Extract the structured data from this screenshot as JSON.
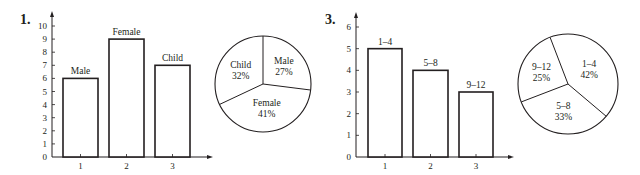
{
  "problems": [
    {
      "number": "1."
    },
    {
      "number": "3."
    }
  ],
  "chart_data": [
    {
      "type": "bar",
      "title": "",
      "categories": [
        "1",
        "2",
        "3"
      ],
      "bar_labels": [
        "Male",
        "Female",
        "Child"
      ],
      "values": [
        6,
        9,
        7
      ],
      "xlabel": "",
      "ylabel": "",
      "ylim": [
        0,
        10
      ],
      "yticks": [
        "0",
        "1",
        "2",
        "3",
        "4",
        "5",
        "6",
        "7",
        "8",
        "9",
        "10"
      ],
      "grid": false
    },
    {
      "type": "pie",
      "title": "",
      "labels": [
        "Male",
        "Female",
        "Child"
      ],
      "values": [
        27,
        41,
        32
      ],
      "value_labels": [
        "27%",
        "41%",
        "32%"
      ]
    },
    {
      "type": "bar",
      "title": "",
      "categories": [
        "1",
        "2",
        "3"
      ],
      "bar_labels": [
        "1–4",
        "5–8",
        "9–12"
      ],
      "values": [
        5,
        4,
        3
      ],
      "xlabel": "",
      "ylabel": "",
      "ylim": [
        0,
        6
      ],
      "yticks": [
        "0",
        "1",
        "2",
        "3",
        "4",
        "5",
        "6"
      ],
      "grid": false
    },
    {
      "type": "pie",
      "title": "",
      "labels": [
        "1–4",
        "5–8",
        "9–12"
      ],
      "values": [
        42,
        33,
        25
      ],
      "value_labels": [
        "42%",
        "33%",
        "25%"
      ]
    }
  ]
}
